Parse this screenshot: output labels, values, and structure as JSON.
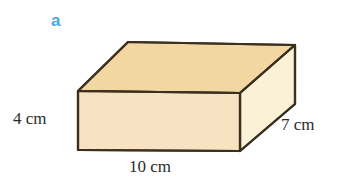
{
  "figure": {
    "type": "rectangular-prism-diagram",
    "part_label": "a",
    "part_label_color": "#52a8df",
    "background_color": "#ffffff",
    "outline_color": "#3b2f1e",
    "faces": {
      "top": {
        "name": "top-face",
        "fill": "#f2d7a2"
      },
      "front": {
        "name": "front-face",
        "fill": "#f7e3c1"
      },
      "right": {
        "name": "right-face",
        "fill": "#fbf1d7"
      }
    },
    "dimensions": [
      {
        "id": "height",
        "label": "4 cm",
        "value": 4,
        "unit": "cm",
        "edge": "vertical-left"
      },
      {
        "id": "length",
        "label": "10 cm",
        "value": 10,
        "unit": "cm",
        "edge": "horizontal-bottom"
      },
      {
        "id": "depth",
        "label": "7 cm",
        "value": 7,
        "unit": "cm",
        "edge": "diagonal-right"
      }
    ],
    "labels": {
      "height": "4 cm",
      "length": "10 cm",
      "depth": "7 cm"
    }
  }
}
